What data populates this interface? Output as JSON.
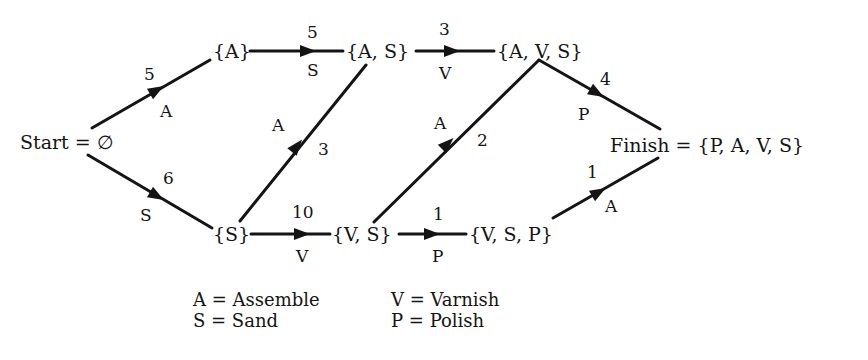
{
  "nodes": {
    "start": "Start = ∅",
    "a": "{A}",
    "as": "{A, S}",
    "avs": "{A, V, S}",
    "s": "{S}",
    "vs": "{V, S}",
    "vsp": "{V, S, P}",
    "finish": "Finish = {P, A, V, S}"
  },
  "edges": [
    {
      "from": "start",
      "to": "a",
      "weight": "5",
      "task": "A"
    },
    {
      "from": "start",
      "to": "s",
      "weight": "6",
      "task": "S"
    },
    {
      "from": "a",
      "to": "as",
      "weight": "5",
      "task": "S"
    },
    {
      "from": "s",
      "to": "as",
      "weight": "3",
      "task": "A"
    },
    {
      "from": "as",
      "to": "avs",
      "weight": "3",
      "task": "V"
    },
    {
      "from": "s",
      "to": "vs",
      "weight": "10",
      "task": "V"
    },
    {
      "from": "vs",
      "to": "avs",
      "weight": "2",
      "task": "A"
    },
    {
      "from": "vs",
      "to": "vsp",
      "weight": "1",
      "task": "P"
    },
    {
      "from": "avs",
      "to": "finish",
      "weight": "4",
      "task": "P"
    },
    {
      "from": "vsp",
      "to": "finish",
      "weight": "1",
      "task": "A"
    }
  ],
  "legend": {
    "a": "A = Assemble",
    "s": "S = Sand",
    "v": "V = Varnish",
    "p": "P = Polish"
  },
  "colors": {
    "line": "#141414",
    "background": "#ffffff"
  }
}
